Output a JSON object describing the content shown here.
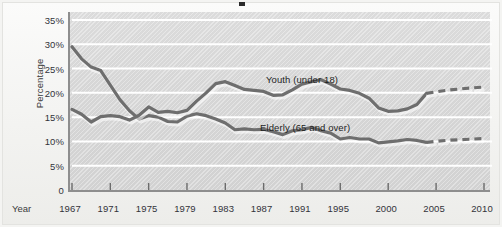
{
  "figure": {
    "background_color": "#f3f3f1",
    "plot_background_color": "#d9d9d9",
    "gridline_color": "#ffffff",
    "axis_color": "#8e8e8e"
  },
  "axes": {
    "x_axis_title": "Year",
    "y_axis_title": "Percentage",
    "y_tick_labels": [
      "35%",
      "30%",
      "25%",
      "20%",
      "15%",
      "10%",
      "5%",
      "0"
    ],
    "x_tick_labels": [
      "1967",
      "1971",
      "1975",
      "1979",
      "1983",
      "1987",
      "1991",
      "1995",
      "2000",
      "2005",
      "2010"
    ]
  },
  "annotations": {
    "youth_label": "Youth (under 18)",
    "elderly_label": "Elderly (65 and over)"
  },
  "chart_data": {
    "type": "line",
    "title": "",
    "subtitle": "",
    "xlabel": "Year",
    "ylabel": "Percentage",
    "xlim": [
      1967,
      2010
    ],
    "ylim": [
      0,
      35
    ],
    "y_tick_values": [
      0,
      5,
      10,
      15,
      20,
      25,
      30,
      35
    ],
    "y_tick_labels": [
      "0",
      "5%",
      "10%",
      "15%",
      "20%",
      "25%",
      "30%",
      "35%"
    ],
    "x_tick_values": [
      1967,
      1971,
      1975,
      1979,
      1983,
      1987,
      1991,
      1995,
      2000,
      2005,
      2010
    ],
    "x_tick_labels": [
      "1967",
      "1971",
      "1975",
      "1979",
      "1983",
      "1987",
      "1991",
      "1995",
      "2000",
      "2005",
      "2010"
    ],
    "grid": "horizontal",
    "legend": "inline-annotations",
    "units": "percent",
    "series": [
      {
        "name": "Elderly (65 and over)",
        "label": "Elderly (65 and over)",
        "color": "#6e6e6e",
        "line_style": "solid",
        "x": [
          1967,
          1968,
          1969,
          1970,
          1971,
          1972,
          1973,
          1974,
          1975,
          1976,
          1977,
          1978,
          1979,
          1980,
          1981,
          1982,
          1983,
          1984,
          1985,
          1986,
          1987,
          1988,
          1989,
          1990,
          1991,
          1992,
          1993,
          1994,
          1995,
          1996,
          1997,
          1998,
          1999,
          2000,
          2001,
          2002,
          2003,
          2004
        ],
        "values": [
          29.5,
          27.0,
          25.3,
          24.6,
          21.6,
          18.6,
          16.3,
          14.6,
          15.3,
          15.0,
          14.1,
          14.0,
          15.2,
          15.7,
          15.3,
          14.6,
          13.8,
          12.4,
          12.6,
          12.4,
          12.5,
          12.0,
          11.4,
          12.2,
          12.4,
          12.9,
          12.2,
          11.7,
          10.5,
          10.8,
          10.5,
          10.5,
          9.7,
          9.9,
          10.1,
          10.4,
          10.2,
          9.8
        ]
      },
      {
        "name": "Elderly (65 and over) projection",
        "label": "Elderly (65 and over)",
        "color": "#6e6e6e",
        "line_style": "dashed",
        "x": [
          2004,
          2006,
          2008,
          2010
        ],
        "values": [
          9.8,
          10.2,
          10.4,
          10.6
        ]
      },
      {
        "name": "Youth (under 18)",
        "label": "Youth (under 18)",
        "color": "#6e6e6e",
        "line_style": "solid",
        "x": [
          1967,
          1968,
          1969,
          1970,
          1971,
          1972,
          1973,
          1974,
          1975,
          1976,
          1977,
          1978,
          1979,
          1980,
          1981,
          1982,
          1983,
          1984,
          1985,
          1986,
          1987,
          1988,
          1989,
          1990,
          1991,
          1992,
          1993,
          1994,
          1995,
          1996,
          1997,
          1998,
          1999,
          2000,
          2001,
          2002,
          2003,
          2004
        ],
        "values": [
          16.6,
          15.6,
          14.0,
          15.1,
          15.3,
          15.1,
          14.4,
          15.4,
          17.1,
          16.0,
          16.2,
          15.9,
          16.4,
          18.3,
          20.0,
          21.9,
          22.3,
          21.5,
          20.7,
          20.5,
          20.3,
          19.5,
          19.6,
          20.6,
          21.8,
          22.3,
          22.7,
          21.8,
          20.8,
          20.5,
          19.9,
          18.9,
          16.9,
          16.2,
          16.3,
          16.7,
          17.6,
          19.9
        ]
      },
      {
        "name": "Youth (under 18) projection",
        "label": "Youth (under 18)",
        "color": "#6e6e6e",
        "line_style": "dashed",
        "x": [
          2004,
          2006,
          2008,
          2010
        ],
        "values": [
          19.9,
          20.5,
          20.9,
          21.2
        ]
      }
    ]
  }
}
